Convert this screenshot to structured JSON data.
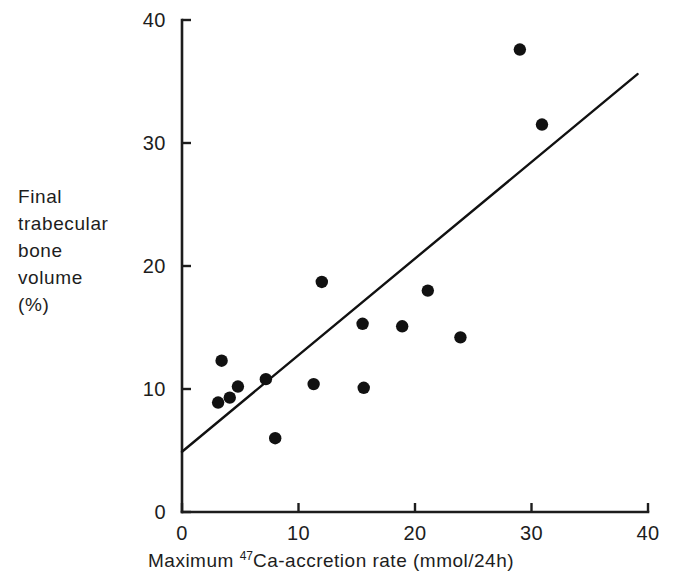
{
  "chart_data": {
    "type": "scatter",
    "title": "",
    "xlabel": "Maximum 47Ca-accretion rate (mmol/24h)",
    "xlabel_prefix": "Maximum ",
    "xlabel_superscript": "47",
    "xlabel_suffix": "Ca-accretion rate (mmol/24h)",
    "ylabel": "Final trabecular bone volume (%)",
    "ylabel_lines": [
      "Final",
      "trabecular",
      "bone",
      "volume",
      "(%)"
    ],
    "xlim": [
      0,
      40
    ],
    "ylim": [
      0,
      40
    ],
    "xticks": [
      0,
      10,
      20,
      30,
      40
    ],
    "yticks": [
      0,
      10,
      20,
      30,
      40
    ],
    "xtick_labels": [
      "0",
      "10",
      "20",
      "30",
      "40"
    ],
    "ytick_labels": [
      "0",
      "10",
      "20",
      "30",
      "40"
    ],
    "grid": false,
    "legend": false,
    "marker": "filled-circle",
    "marker_color": "#111111",
    "line_color": "#111111",
    "axis_color": "#1d1d1d",
    "points": [
      {
        "x": 3.1,
        "y": 8.9
      },
      {
        "x": 3.4,
        "y": 12.3
      },
      {
        "x": 4.1,
        "y": 9.3
      },
      {
        "x": 4.8,
        "y": 10.2
      },
      {
        "x": 7.2,
        "y": 10.8
      },
      {
        "x": 8.0,
        "y": 6.0
      },
      {
        "x": 11.3,
        "y": 10.4
      },
      {
        "x": 12.0,
        "y": 18.7
      },
      {
        "x": 15.5,
        "y": 15.3
      },
      {
        "x": 15.6,
        "y": 10.1
      },
      {
        "x": 18.9,
        "y": 15.1
      },
      {
        "x": 21.1,
        "y": 18.0
      },
      {
        "x": 23.9,
        "y": 14.2
      },
      {
        "x": 29.0,
        "y": 37.6
      },
      {
        "x": 30.9,
        "y": 31.5
      }
    ],
    "trendline": {
      "type": "linear-fit",
      "x_start": 0,
      "y_start": 4.9,
      "x_end": 39.1,
      "y_end": 35.6
    }
  }
}
